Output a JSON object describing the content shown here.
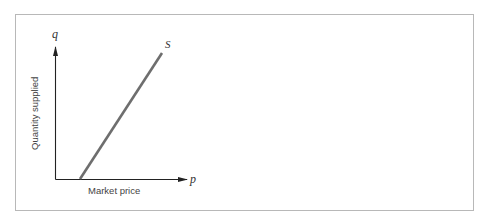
{
  "diagram": {
    "title": "",
    "y_axis": {
      "symbol": "q",
      "label": "Quantity supplied"
    },
    "x_axis": {
      "symbol": "p",
      "label": "Market price"
    },
    "curve": {
      "label": "S",
      "color": "#6e6e6e"
    },
    "colors": {
      "axis": "#222222",
      "frame": "#b8b8b8",
      "curve": "#6e6e6e"
    }
  }
}
